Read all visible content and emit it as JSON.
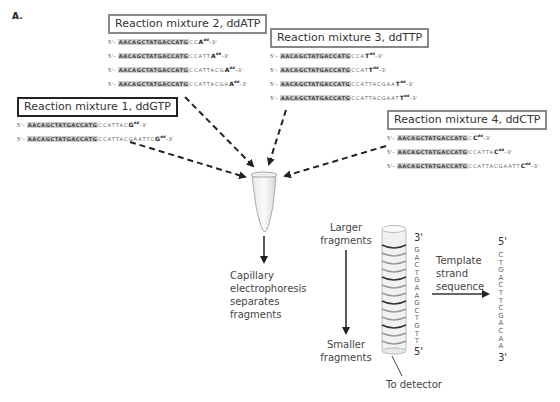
{
  "panel_label": "A.",
  "mixtures": [
    {
      "title": "Reaction mixture 1, ddGTP",
      "sequences": [
        {
          "five": "5'–",
          "primer": "AACAGCTATGACCATG",
          "ext": "CCATTAC",
          "term": "G",
          "dd": "dd",
          "three": "–3'"
        },
        {
          "five": "5'–",
          "primer": "AACAGCTATGACCATG",
          "ext": "CCATTACGAATTC",
          "term": "G",
          "dd": "dd",
          "three": "–3'"
        }
      ]
    },
    {
      "title": "Reaction mixture 2, ddATP",
      "sequences": [
        {
          "five": "5'–",
          "primer": "AACAGCTATGACCATG",
          "ext": "CC",
          "term": "A",
          "dd": "dd",
          "three": "–3'"
        },
        {
          "five": "5'–",
          "primer": "AACAGCTATGACCATG",
          "ext": "CCATT",
          "term": "A",
          "dd": "dd",
          "three": "–3'"
        },
        {
          "five": "5'–",
          "primer": "AACAGCTATGACCATG",
          "ext": "CCATTACG",
          "term": "A",
          "dd": "dd",
          "three": "–3'"
        },
        {
          "five": "5'–",
          "primer": "AACAGCTATGACCATG",
          "ext": "CCATTACGA",
          "term": "A",
          "dd": "dd",
          "three": "–3'"
        }
      ]
    },
    {
      "title": "Reaction mixture 3, ddTTP",
      "sequences": [
        {
          "five": "5'–",
          "primer": "AACAGCTATGACCATG",
          "ext": "CCA",
          "term": "T",
          "dd": "dd",
          "three": "–3'"
        },
        {
          "five": "5'–",
          "primer": "AACAGCTATGACCATG",
          "ext": "CCAT",
          "term": "T",
          "dd": "dd",
          "three": "–3'"
        },
        {
          "five": "5'–",
          "primer": "AACAGCTATGACCATG",
          "ext": "CCATTACGAA",
          "term": "T",
          "dd": "dd",
          "three": "–3'"
        },
        {
          "five": "5'–",
          "primer": "AACAGCTATGACCATG",
          "ext": "CCATTACGAAT",
          "term": "T",
          "dd": "dd",
          "three": "–3'"
        }
      ]
    },
    {
      "title": "Reaction mixture 4, ddCTP",
      "sequences": [
        {
          "five": "5'–",
          "primer": "AACAGCTATGACCATG",
          "ext": "C",
          "term": "C",
          "dd": "dd",
          "three": "–3'"
        },
        {
          "five": "5'–",
          "primer": "AACAGCTATGACCATG",
          "ext": "CCATTA",
          "term": "C",
          "dd": "dd",
          "three": "–3'"
        },
        {
          "five": "5'–",
          "primer": "AACAGCTATGACCATG",
          "ext": "CCATTACGAATT",
          "term": "C",
          "dd": "dd",
          "three": "–3'"
        }
      ]
    }
  ],
  "electrophoresis_label": [
    "Capillary",
    "electrophoresis",
    "separates",
    "fragments"
  ],
  "larger_label": [
    "Larger",
    "fragments"
  ],
  "smaller_label": [
    "Smaller",
    "fragments"
  ],
  "detector_label": "To detector",
  "column": {
    "top_end": "3'",
    "bottom_end": "5'",
    "bases": [
      "G",
      "A",
      "C",
      "T",
      "G",
      "A",
      "A",
      "G",
      "C",
      "T",
      "G",
      "T",
      "T"
    ]
  },
  "template_label": [
    "Template",
    "strand",
    "sequence"
  ],
  "template": {
    "top_end": "5'",
    "bottom_end": "3'",
    "bases": [
      "C",
      "T",
      "G",
      "A",
      "C",
      "T",
      "T",
      "C",
      "G",
      "A",
      "C",
      "A",
      "A"
    ]
  },
  "colors": {
    "primer_highlight": "#cfcfcf",
    "box_border_gray": "#888888",
    "box_border_dark": "#222222",
    "arrow": "#222222"
  }
}
